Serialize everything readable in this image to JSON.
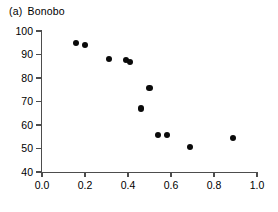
{
  "figure": {
    "panel_tag": "(a)",
    "panel_title": "Bonobo"
  },
  "chart_data": {
    "type": "scatter",
    "xlabel": "",
    "ylabel": "",
    "xlim": [
      0.0,
      1.0
    ],
    "ylim": [
      40,
      100
    ],
    "xticks": [
      0.0,
      0.2,
      0.4,
      0.6,
      0.8,
      1.0
    ],
    "xtick_labels": [
      "0.0",
      "0.2",
      "0.4",
      "0.6",
      "0.8",
      "1.0"
    ],
    "yticks": [
      40,
      50,
      60,
      70,
      80,
      90,
      100
    ],
    "ytick_labels": [
      "40",
      "50",
      "60",
      "70",
      "80",
      "90",
      "100"
    ],
    "grid": false,
    "legend": false,
    "marker": "filled-circle",
    "marker_color": "#0a0a0a",
    "axis_color": "#4d4d4d",
    "series": [
      {
        "name": "Bonobo",
        "points": [
          {
            "x": 0.16,
            "y": 95.0
          },
          {
            "x": 0.2,
            "y": 94.0
          },
          {
            "x": 0.31,
            "y": 88.0
          },
          {
            "x": 0.39,
            "y": 87.5
          },
          {
            "x": 0.41,
            "y": 86.8
          },
          {
            "x": 0.46,
            "y": 67.0
          },
          {
            "x": 0.5,
            "y": 75.8
          },
          {
            "x": 0.54,
            "y": 55.8
          },
          {
            "x": 0.58,
            "y": 55.8
          },
          {
            "x": 0.69,
            "y": 50.6
          },
          {
            "x": 0.89,
            "y": 54.5
          }
        ]
      }
    ]
  }
}
